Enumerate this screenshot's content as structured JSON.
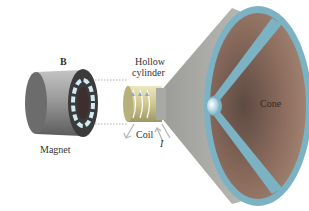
{
  "diagram": {
    "labels": {
      "field": "B",
      "magnet": "Magnet",
      "hollow_cylinder_line1": "Hollow",
      "hollow_cylinder_line2": "cylinder",
      "coil": "Coil",
      "current": "I",
      "cone": "Cone"
    },
    "colors": {
      "magnet_body": "#8a8a8a",
      "magnet_face": "#3a3a3a",
      "magnet_ring": "#bfe0ea",
      "coil_cylinder": "#d8d2a0",
      "coil_wire": "#ffffff",
      "cone_outer": "#a9a9a6",
      "cone_inner": "#8a6a5a",
      "cone_rim": "#7fb0c2",
      "dust_cap": "#d6eef4",
      "arrow": "#aaaaaa",
      "dashed_line": "#999999"
    }
  }
}
